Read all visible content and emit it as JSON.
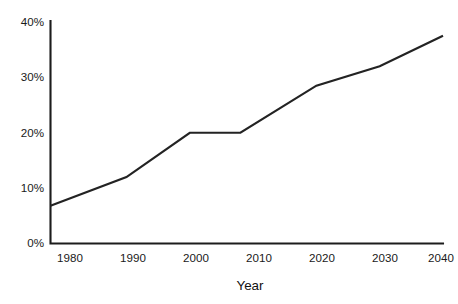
{
  "chart_data": {
    "type": "line",
    "title": "",
    "xlabel": "Year",
    "ylabel": "",
    "x": [
      1978,
      1990,
      2000,
      2008,
      2020,
      2030,
      2040
    ],
    "values": [
      6.8,
      12.0,
      20.0,
      20.0,
      28.5,
      32.0,
      37.5
    ],
    "series": [
      {
        "name": "",
        "values": [
          6.8,
          12.0,
          20.0,
          20.0,
          28.5,
          32.0,
          37.5
        ]
      }
    ],
    "xlim": [
      1978,
      2040
    ],
    "ylim": [
      0,
      40
    ],
    "xticks": [
      1980,
      1990,
      2000,
      2010,
      2020,
      2030,
      2040
    ],
    "xtick_labels": [
      "1980",
      "1990",
      "2000",
      "2010",
      "2020",
      "2030",
      "2040"
    ],
    "yticks": [
      0,
      10,
      20,
      30,
      40
    ],
    "ytick_labels": [
      "0%",
      "10%",
      "20%",
      "30%",
      "40%"
    ],
    "grid": false,
    "legend": false,
    "legend_position": "none",
    "line_color": "#232323",
    "axis_color": "#1c1c1c",
    "background_color": "#ffffff"
  },
  "axes": {
    "x_title": "Year"
  }
}
